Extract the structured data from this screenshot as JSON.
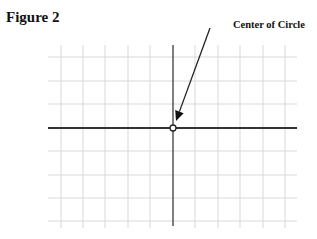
{
  "figure": {
    "title": "Figure 2",
    "annotation": "Center of Circle"
  },
  "grid": {
    "x_lines": [
      61,
      83,
      105,
      128,
      150,
      195,
      218,
      240,
      263,
      285
    ],
    "y_lines": [
      57,
      81,
      104,
      151,
      175,
      198,
      221
    ],
    "x_range": [
      48,
      297
    ],
    "y_range": [
      45,
      228
    ],
    "grid_color": "#d9d9d9",
    "axis_color": "#333333"
  },
  "axes": {
    "origin": [
      173,
      128
    ],
    "horizontal": {
      "x1": 48,
      "x2": 297
    },
    "vertical": {
      "y1": 45,
      "y2": 226
    }
  },
  "center_point": {
    "x": 173,
    "y": 128,
    "r": 3,
    "style": "open-circle"
  },
  "arrow": {
    "from": [
      210,
      28
    ],
    "to": [
      176,
      121
    ]
  }
}
